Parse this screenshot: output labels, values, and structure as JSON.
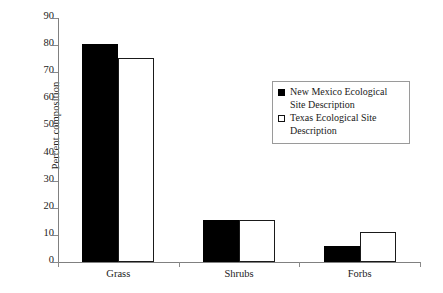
{
  "chart_data": {
    "type": "bar",
    "title": "",
    "subtitle": "",
    "xlabel": "",
    "ylabel": "Percent composition",
    "categories": [
      "Grass",
      "Shrubs",
      "Forbs"
    ],
    "series": [
      {
        "name": "New Mexico Ecological Site Description",
        "style": "filled-black",
        "values": [
          80.3,
          15.5,
          5.8
        ]
      },
      {
        "name": "Texas Ecological Site Description",
        "style": "open-white",
        "values": [
          75.3,
          15.6,
          11.0
        ]
      }
    ],
    "ylim": [
      0,
      90
    ],
    "ytick_step": 10,
    "yticks": [
      0,
      10,
      20,
      30,
      40,
      50,
      60,
      70,
      80,
      90
    ],
    "ytick_labels": [
      "0",
      "10",
      "20",
      "30",
      "40",
      "50",
      "60",
      "70",
      "80",
      "90"
    ],
    "grid": false,
    "legend_position": "upper-right-inside",
    "legend_entries": [
      "New Mexico Ecological Site Description",
      "Texas Ecological Site Description"
    ],
    "colors": {
      "series_1": "#000000",
      "series_2": "#ffffff",
      "series_2_border": "#1a1a1a",
      "axis": "#808080",
      "text": "#1a1a1a",
      "background": "#ffffff"
    }
  }
}
